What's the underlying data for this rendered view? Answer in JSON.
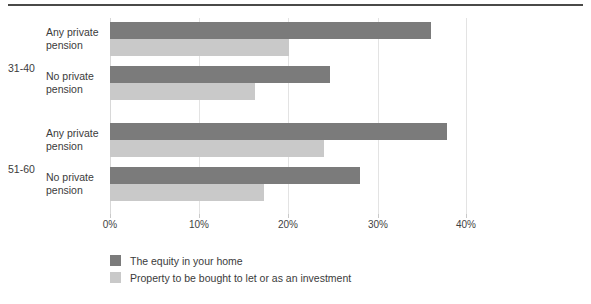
{
  "chart_data": {
    "type": "bar",
    "orientation": "horizontal",
    "title": "",
    "xlabel": "",
    "ylabel": "",
    "xlim": [
      0,
      40
    ],
    "grid": true,
    "legend_position": "bottom-left",
    "xticks": [
      "0%",
      "10%",
      "20%",
      "30%",
      "40%"
    ],
    "xtick_values": [
      0,
      10,
      20,
      30,
      40
    ],
    "groups": [
      {
        "name": "31-40",
        "categories": [
          {
            "label_line1": "Any private",
            "label_line2": "pension",
            "values": {
              "equity": 36.0,
              "property": 20.0
            }
          },
          {
            "label_line1": "No private",
            "label_line2": "pension",
            "values": {
              "equity": 24.6,
              "property": 16.3
            }
          }
        ]
      },
      {
        "name": "51-60",
        "categories": [
          {
            "label_line1": "Any private",
            "label_line2": "pension",
            "values": {
              "equity": 37.8,
              "property": 24.0
            }
          },
          {
            "label_line1": "No private",
            "label_line2": "pension",
            "values": {
              "equity": 28.0,
              "property": 17.3
            }
          }
        ]
      }
    ],
    "series": [
      {
        "name": "The equity in your home",
        "key": "equity",
        "color": "#7b7b7b",
        "values": [
          36.0,
          24.6,
          37.8,
          28.0
        ]
      },
      {
        "name": "Property to be bought to let or as an investment",
        "key": "property",
        "color": "#c9c9c9",
        "values": [
          20.0,
          16.3,
          24.0,
          17.3
        ]
      }
    ],
    "categories": [
      "31-40 / Any private pension",
      "31-40 / No private pension",
      "51-60 / Any private pension",
      "51-60 / No private pension"
    ]
  },
  "legend": {
    "items": [
      {
        "label": "The equity in your home",
        "color": "#7b7b7b"
      },
      {
        "label": "Property to be bought to let or as an investment",
        "color": "#c9c9c9"
      }
    ]
  }
}
